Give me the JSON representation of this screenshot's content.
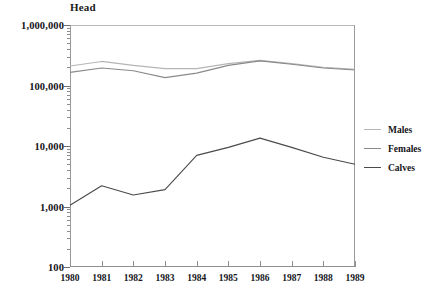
{
  "chart_data": {
    "type": "line",
    "title": "",
    "ylabel": "Head",
    "xlabel": "",
    "yscale": "log",
    "ylim": [
      100,
      1000000
    ],
    "ytick_labels": [
      "1,000,000",
      "100,000",
      "10,000",
      "1,000",
      "100"
    ],
    "ytick_values": [
      1000000,
      100000,
      10000,
      1000,
      100
    ],
    "grid": false,
    "legend_position": "right",
    "x": [
      1980,
      1981,
      1982,
      1983,
      1984,
      1985,
      1986,
      1987,
      1988,
      1989
    ],
    "categories": [
      "1980",
      "1981",
      "1982",
      "1983",
      "1984",
      "1985",
      "1986",
      "1987",
      "1988",
      "1989"
    ],
    "series": [
      {
        "name": "Males",
        "color": "#b5b5b5",
        "values": [
          210000,
          250000,
          215000,
          190000,
          190000,
          230000,
          260000,
          230000,
          200000,
          185000
        ]
      },
      {
        "name": "Females",
        "color": "#8a8a8a",
        "values": [
          165000,
          195000,
          175000,
          135000,
          160000,
          215000,
          255000,
          225000,
          195000,
          180000
        ]
      },
      {
        "name": "Calves",
        "color": "#4a4a4a",
        "values": [
          1050,
          2200,
          1550,
          1900,
          7000,
          9500,
          13500,
          9500,
          6500,
          5000
        ]
      }
    ]
  },
  "legend": {
    "items": [
      {
        "label": "Males",
        "color": "#b5b5b5"
      },
      {
        "label": "Females",
        "color": "#8a8a8a"
      },
      {
        "label": "Calves",
        "color": "#4a4a4a"
      }
    ]
  },
  "caption": ""
}
